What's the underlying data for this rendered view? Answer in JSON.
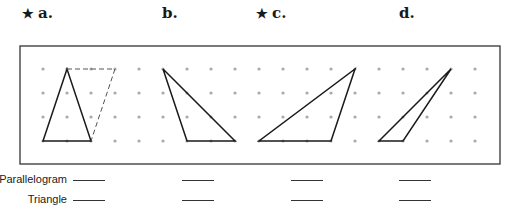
{
  "problems": [
    {
      "id": "a",
      "label": "a.",
      "starred": true,
      "star": "★",
      "x": 22
    },
    {
      "id": "b",
      "label": "b.",
      "starred": false,
      "star": "",
      "x": 162
    },
    {
      "id": "c",
      "label": "c.",
      "starred": true,
      "star": "★",
      "x": 256
    },
    {
      "id": "d",
      "label": "d.",
      "starred": false,
      "star": "",
      "x": 399
    }
  ],
  "grid": {
    "box": {
      "x": 20,
      "y": 46,
      "w": 480,
      "h": 118
    },
    "dot_color": "#aaaaaa",
    "line_color": "#1a1a1a",
    "dot_columns": [
      43,
      67,
      91,
      115,
      139,
      163,
      187,
      211,
      235,
      259,
      283,
      307,
      331,
      355,
      379,
      403,
      427,
      451,
      475
    ],
    "dot_rows": [
      69,
      93,
      117,
      141
    ],
    "shapes": [
      {
        "name": "triangle-a",
        "points": "67,69 43,141 91,141",
        "dashed": false
      },
      {
        "name": "parallelogram-a-dashed",
        "points": "67,69 115,69 91,141",
        "dashed": true
      },
      {
        "name": "triangle-b",
        "points": "163,69 187,141 235,141",
        "dashed": false
      },
      {
        "name": "triangle-c",
        "points": "259,141 331,141 355,69",
        "dashed": false
      },
      {
        "name": "triangle-d",
        "points": "379,141 403,141 451,69",
        "dashed": false
      }
    ]
  },
  "answers": {
    "rows": [
      {
        "label": "Parallelogram",
        "y": 180
      },
      {
        "label": "Triangle",
        "y": 200
      }
    ],
    "blank_columns": [
      73,
      182,
      291,
      399
    ]
  }
}
